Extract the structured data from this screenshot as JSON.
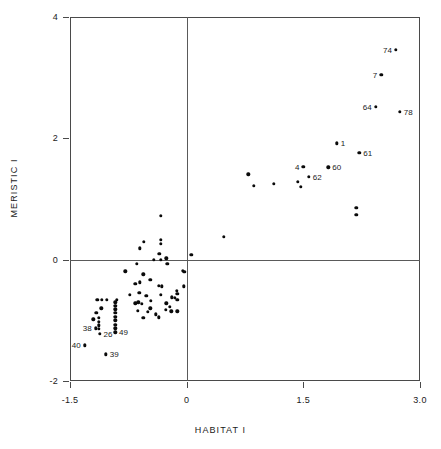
{
  "chart_data": {
    "type": "scatter",
    "title": "",
    "xlabel": "HABITAT  I",
    "ylabel": "MERISTIC  I",
    "xlim": [
      -1.5,
      3.0
    ],
    "ylim": [
      -2,
      4
    ],
    "xticks": [
      -1.5,
      0,
      1.5,
      3.0
    ],
    "xtick_labels": [
      "-1.5",
      "0",
      "1.5",
      "3.0"
    ],
    "yticks": [
      -2,
      0,
      2,
      4
    ],
    "ytick_labels": [
      "-2",
      "0",
      "2",
      "4"
    ],
    "grid": false,
    "reference_lines": {
      "x": 0,
      "y": 0
    },
    "legend": null,
    "marker": "filled-circle",
    "marker_color": "#000000",
    "points": [
      {
        "x": 2.69,
        "y": 3.46,
        "label": "74",
        "label_side": "left"
      },
      {
        "x": 2.5,
        "y": 3.05,
        "label": "7",
        "label_side": "left"
      },
      {
        "x": 2.43,
        "y": 2.52,
        "label": "64",
        "label_side": "left"
      },
      {
        "x": 2.74,
        "y": 2.44,
        "label": "78",
        "label_side": "right"
      },
      {
        "x": 1.93,
        "y": 1.92,
        "label": "1",
        "label_side": "right"
      },
      {
        "x": 2.22,
        "y": 1.76,
        "label": "61",
        "label_side": "right"
      },
      {
        "x": 1.5,
        "y": 1.53,
        "label": "4",
        "label_side": "left"
      },
      {
        "x": 1.82,
        "y": 1.52,
        "label": "60",
        "label_side": "right"
      },
      {
        "x": 1.57,
        "y": 1.37,
        "label": "62",
        "label_side": "right"
      },
      {
        "x": 0.79,
        "y": 1.41,
        "label": null
      },
      {
        "x": 0.86,
        "y": 1.22,
        "label": null
      },
      {
        "x": 1.12,
        "y": 1.25,
        "label": null
      },
      {
        "x": 1.43,
        "y": 1.28,
        "label": null
      },
      {
        "x": 1.47,
        "y": 1.2,
        "label": null
      },
      {
        "x": 2.18,
        "y": 0.85,
        "label": null
      },
      {
        "x": 2.18,
        "y": 0.74,
        "label": null
      },
      {
        "x": 0.48,
        "y": 0.38,
        "label": null
      },
      {
        "x": -0.33,
        "y": 0.72,
        "label": null
      },
      {
        "x": -0.33,
        "y": 0.33,
        "label": null
      },
      {
        "x": -0.33,
        "y": 0.26,
        "label": null
      },
      {
        "x": -0.55,
        "y": 0.29,
        "label": null
      },
      {
        "x": -0.6,
        "y": 0.19,
        "label": null
      },
      {
        "x": -0.35,
        "y": 0.1,
        "label": null
      },
      {
        "x": 0.06,
        "y": 0.08,
        "label": null
      },
      {
        "x": -0.33,
        "y": 0.0,
        "label": null
      },
      {
        "x": -0.42,
        "y": 0.0,
        "label": null
      },
      {
        "x": -0.26,
        "y": 0.02,
        "label": null
      },
      {
        "x": -0.64,
        "y": -0.07,
        "label": null
      },
      {
        "x": -0.25,
        "y": -0.07,
        "label": null
      },
      {
        "x": -0.05,
        "y": -0.18,
        "label": null
      },
      {
        "x": -0.03,
        "y": -0.2,
        "label": null
      },
      {
        "x": -0.56,
        "y": -0.24,
        "label": null
      },
      {
        "x": -0.79,
        "y": -0.19,
        "label": null
      },
      {
        "x": -0.47,
        "y": -0.33,
        "label": null
      },
      {
        "x": -0.6,
        "y": -0.37,
        "label": null
      },
      {
        "x": -0.66,
        "y": -0.4,
        "label": null
      },
      {
        "x": -0.36,
        "y": -0.43,
        "label": null
      },
      {
        "x": -0.04,
        "y": -0.44,
        "label": null
      },
      {
        "x": -0.32,
        "y": -0.44,
        "label": null
      },
      {
        "x": -0.61,
        "y": -0.55,
        "label": null
      },
      {
        "x": -0.52,
        "y": -0.6,
        "label": null
      },
      {
        "x": -0.33,
        "y": -0.58,
        "label": null
      },
      {
        "x": -0.73,
        "y": -0.58,
        "label": null
      },
      {
        "x": -0.19,
        "y": -0.62,
        "label": null
      },
      {
        "x": -0.15,
        "y": -0.63,
        "label": null
      },
      {
        "x": -0.12,
        "y": -0.66,
        "label": null
      },
      {
        "x": -0.46,
        "y": -0.68,
        "label": null
      },
      {
        "x": -0.62,
        "y": -0.7,
        "label": null
      },
      {
        "x": -0.66,
        "y": -0.72,
        "label": null
      },
      {
        "x": -0.58,
        "y": -0.73,
        "label": null
      },
      {
        "x": -0.9,
        "y": -0.66,
        "label": null
      },
      {
        "x": -1.03,
        "y": -0.66,
        "label": null
      },
      {
        "x": -1.09,
        "y": -0.66,
        "label": null
      },
      {
        "x": -1.15,
        "y": -0.66,
        "label": null
      },
      {
        "x": -0.92,
        "y": -0.7,
        "label": null
      },
      {
        "x": -0.92,
        "y": -0.76,
        "label": null
      },
      {
        "x": -0.92,
        "y": -0.82,
        "label": null
      },
      {
        "x": -0.92,
        "y": -0.88,
        "label": null
      },
      {
        "x": -0.92,
        "y": -0.94,
        "label": null
      },
      {
        "x": -0.92,
        "y": -1.0,
        "label": null
      },
      {
        "x": -0.92,
        "y": -1.07,
        "label": null
      },
      {
        "x": -0.92,
        "y": -1.13,
        "label": null
      },
      {
        "x": -1.1,
        "y": -0.8,
        "label": null
      },
      {
        "x": -1.16,
        "y": -0.88,
        "label": null
      },
      {
        "x": -1.13,
        "y": -0.96,
        "label": null
      },
      {
        "x": -1.13,
        "y": -1.02,
        "label": null
      },
      {
        "x": -1.13,
        "y": -1.08,
        "label": null
      },
      {
        "x": -1.13,
        "y": -1.14,
        "label": null
      },
      {
        "x": -1.2,
        "y": -0.98,
        "label": null
      },
      {
        "x": -0.47,
        "y": -0.8,
        "label": null
      },
      {
        "x": -0.5,
        "y": -0.86,
        "label": null
      },
      {
        "x": -0.63,
        "y": -0.84,
        "label": null
      },
      {
        "x": -0.26,
        "y": -0.72,
        "label": null
      },
      {
        "x": -0.22,
        "y": -0.78,
        "label": null
      },
      {
        "x": -0.27,
        "y": -0.83,
        "label": null
      },
      {
        "x": -0.2,
        "y": -0.85,
        "label": null
      },
      {
        "x": -0.4,
        "y": -0.9,
        "label": null
      },
      {
        "x": -0.36,
        "y": -0.95,
        "label": null
      },
      {
        "x": -0.56,
        "y": -0.96,
        "label": null
      },
      {
        "x": -0.12,
        "y": -0.56,
        "label": null
      },
      {
        "x": -0.12,
        "y": -0.85,
        "label": null
      },
      {
        "x": -0.13,
        "y": -0.51,
        "label": null
      },
      {
        "x": -1.17,
        "y": -1.13,
        "label": "38",
        "label_side": "left"
      },
      {
        "x": -1.12,
        "y": -1.22,
        "label": "26",
        "label_side": "right"
      },
      {
        "x": -0.92,
        "y": -1.2,
        "label": "49",
        "label_side": "right"
      },
      {
        "x": -1.31,
        "y": -1.41,
        "label": "40",
        "label_side": "left"
      },
      {
        "x": -1.04,
        "y": -1.56,
        "label": "39",
        "label_side": "right"
      }
    ]
  }
}
